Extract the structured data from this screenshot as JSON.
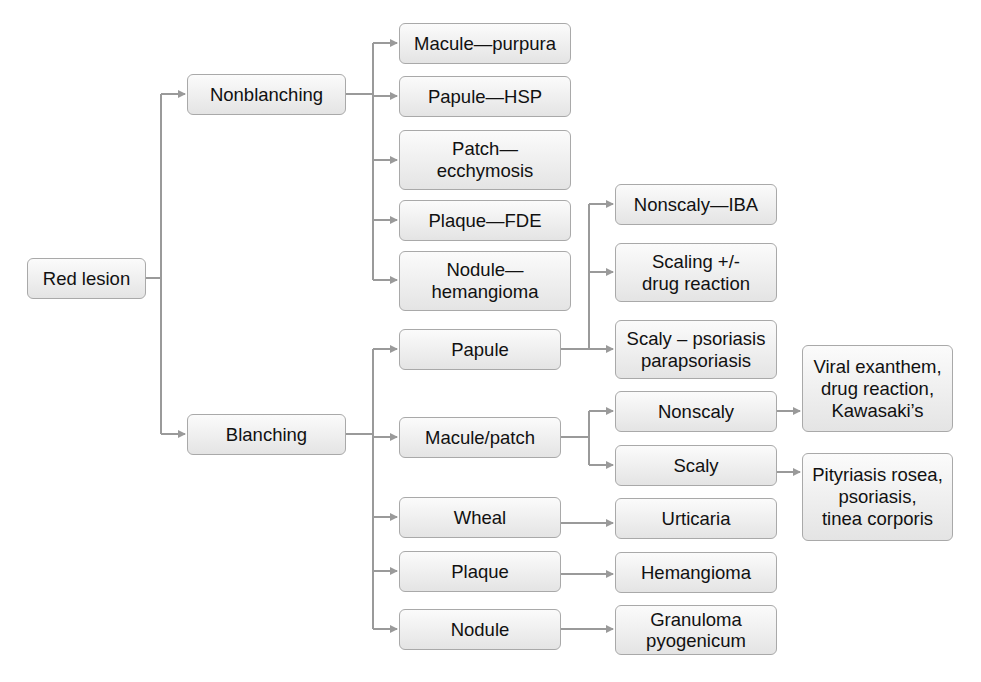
{
  "diagram": {
    "type": "flowchart",
    "root": "Red lesion",
    "nodes": {
      "red_lesion": "Red lesion",
      "nonblanching": "Nonblanching",
      "blanching": "Blanching",
      "macule_purpura": "Macule—purpura",
      "papule_hsp": "Papule—HSP",
      "patch_ecchymosis": "Patch—\necchymosis",
      "plaque_fde": "Plaque—FDE",
      "nodule_hemangioma": "Nodule—\nhemangioma",
      "papule": "Papule",
      "macule_patch": "Macule/patch",
      "wheal": "Wheal",
      "plaque": "Plaque",
      "nodule": "Nodule",
      "nonscaly_iba": "Nonscaly—IBA",
      "scaling_drug": "Scaling +/-\ndrug reaction",
      "scaly_psoriasis": "Scaly – psoriasis\nparapsoriasis",
      "nonscaly": "Nonscaly",
      "scaly": "Scaly",
      "urticaria": "Urticaria",
      "hemangioma": "Hemangioma",
      "granuloma": "Granuloma\npyogenicum",
      "viral_exanthem": "Viral exanthem,\ndrug reaction,\nKawasaki’s",
      "pityriasis": "Pityriasis rosea,\npsoriasis,\ntinea corporis"
    },
    "edges": [
      [
        "Red lesion",
        "Nonblanching"
      ],
      [
        "Red lesion",
        "Blanching"
      ],
      [
        "Nonblanching",
        "Macule—purpura"
      ],
      [
        "Nonblanching",
        "Papule—HSP"
      ],
      [
        "Nonblanching",
        "Patch—ecchymosis"
      ],
      [
        "Nonblanching",
        "Plaque—FDE"
      ],
      [
        "Nonblanching",
        "Nodule—hemangioma"
      ],
      [
        "Blanching",
        "Papule"
      ],
      [
        "Blanching",
        "Macule/patch"
      ],
      [
        "Blanching",
        "Wheal"
      ],
      [
        "Blanching",
        "Plaque"
      ],
      [
        "Blanching",
        "Nodule"
      ],
      [
        "Papule",
        "Nonscaly—IBA"
      ],
      [
        "Papule",
        "Scaling +/- drug reaction"
      ],
      [
        "Papule",
        "Scaly – psoriasis parapsoriasis"
      ],
      [
        "Macule/patch",
        "Nonscaly"
      ],
      [
        "Macule/patch",
        "Scaly"
      ],
      [
        "Nonscaly",
        "Viral exanthem, drug reaction, Kawasaki’s"
      ],
      [
        "Scaly",
        "Pityriasis rosea, psoriasis, tinea corporis"
      ],
      [
        "Wheal",
        "Urticaria"
      ],
      [
        "Plaque",
        "Hemangioma"
      ],
      [
        "Nodule",
        "Granuloma pyogenicum"
      ]
    ],
    "colors": {
      "line": "#9a9a9a",
      "border": "#a9a9a9",
      "fill_top": "#fbfbfb",
      "fill_bottom": "#e4e4e4",
      "text": "#111111"
    }
  }
}
